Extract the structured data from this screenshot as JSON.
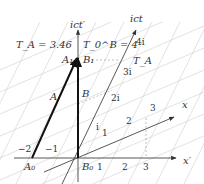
{
  "diagram": {
    "type": "minkowski-spacetime-diagram",
    "axes": {
      "ict_prime": "ict′",
      "ict": "ict",
      "x_prime": "x′",
      "x": "x"
    },
    "annotations": {
      "TA_value": "T_A = 3.46",
      "T0B_value": "T_0^B = 4",
      "TA_label": "T_A"
    },
    "points": {
      "A0": "A₀",
      "A1": "A₁",
      "B0": "B₀",
      "B1": "B₁"
    },
    "worldlines": {
      "A": "A",
      "B": "B"
    },
    "ict_ticks": [
      "i",
      "2i",
      "3i",
      "4i"
    ],
    "x_ticks": [
      "1",
      "2",
      "3"
    ],
    "x_prime_ticks": [
      "1",
      "2",
      "3"
    ],
    "x_prime_negative_ticks": [
      "−2",
      "−1"
    ],
    "colors": {
      "axis": "#444444",
      "worldline": "#222222",
      "grid": "#c8c8c8"
    }
  }
}
